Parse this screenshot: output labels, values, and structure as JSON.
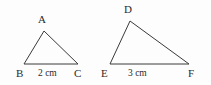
{
  "figure": {
    "background_color": "#fdfdfd",
    "stroke_color": "#3a3a3a",
    "text_color": "#2b2b2b",
    "stroke_width": 1
  },
  "triangles": [
    {
      "name": "triangle-abc",
      "vertices": [
        {
          "label": "A",
          "x": 44,
          "y": 31,
          "label_x": 38,
          "label_y": 14
        },
        {
          "label": "B",
          "x": 24,
          "y": 64,
          "label_x": 16,
          "label_y": 68
        },
        {
          "label": "C",
          "x": 78,
          "y": 64,
          "label_x": 74,
          "label_y": 68
        }
      ],
      "base_label": {
        "text": "2 cm",
        "x": 38,
        "y": 69
      },
      "polygon_points": "44,31 24,64 78,64"
    },
    {
      "name": "triangle-def",
      "vertices": [
        {
          "label": "D",
          "x": 130,
          "y": 21,
          "label_x": 124,
          "label_y": 4
        },
        {
          "label": "E",
          "x": 110,
          "y": 64,
          "label_x": 101,
          "label_y": 68
        },
        {
          "label": "F",
          "x": 189,
          "y": 64,
          "label_x": 188,
          "label_y": 68
        }
      ],
      "base_label": {
        "text": "3 cm",
        "x": 128,
        "y": 69
      },
      "polygon_points": "130,21 110,64 189,64"
    }
  ]
}
